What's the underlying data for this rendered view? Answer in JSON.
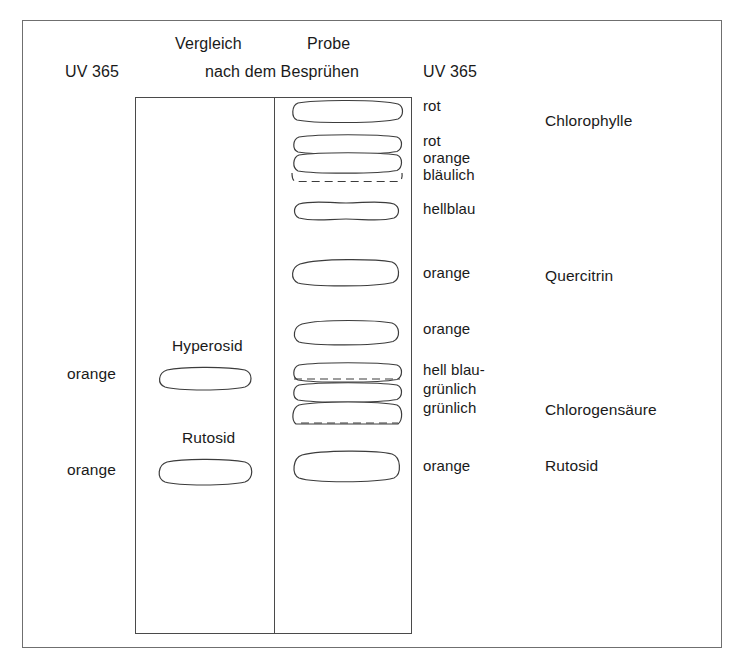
{
  "figure": {
    "headers": {
      "reference_lane": "Vergleich",
      "sample_lane": "Probe",
      "condition": "nach dem Besprühen",
      "detection_left": "UV 365",
      "detection_right": "UV 365"
    },
    "reference_lane": {
      "standards": [
        {
          "name": "Hyperosid",
          "color_label": "orange"
        },
        {
          "name": "Rutosid",
          "color_label": "orange"
        }
      ]
    },
    "sample_lane": {
      "bands": [
        {
          "color_label": "rot"
        },
        {
          "color_label": "rot"
        },
        {
          "color_label": "orange"
        },
        {
          "color_label": "bläulich"
        },
        {
          "color_label": "hellblau"
        },
        {
          "color_label": "orange"
        },
        {
          "color_label": "orange"
        },
        {
          "color_label": "hell blau-"
        },
        {
          "color_label": "grünlich"
        },
        {
          "color_label": "grünlich"
        },
        {
          "color_label": "orange"
        }
      ]
    },
    "assignments": [
      {
        "compound": "Chlorophylle"
      },
      {
        "compound": "Quercitrin"
      },
      {
        "compound": "Chlorogensäure"
      },
      {
        "compound": "Rutosid"
      }
    ]
  },
  "colors": {
    "frame": "#6f6f6f",
    "plate_border": "#4a4a4a",
    "spot_outline": "#3c3c3c",
    "text": "#1a1a1a",
    "background": "#ffffff"
  }
}
